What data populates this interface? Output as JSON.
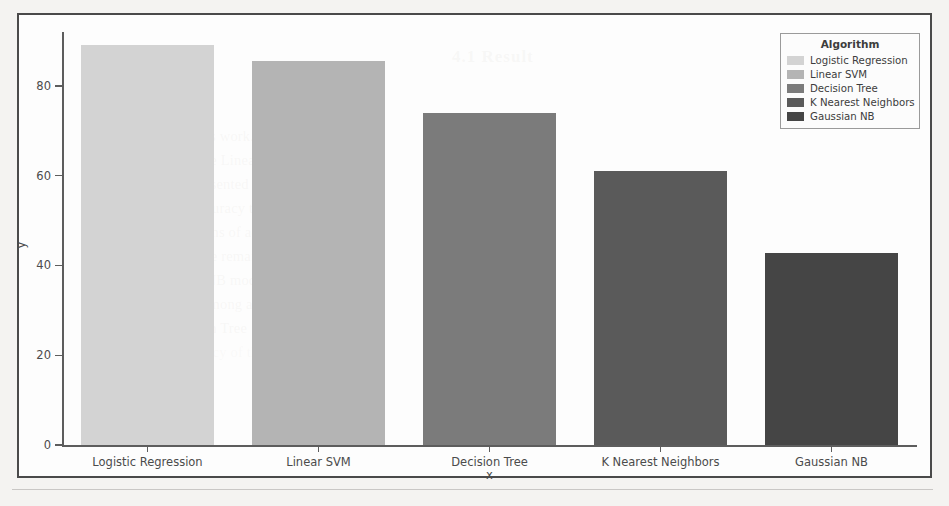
{
  "document": {
    "bleed_heading": "4.1  Result",
    "bleed_lines": [
      "considered in this work. The",
      "classification in the Linear SVM model",
      "features are presented in table-1. This",
      "that has better accuracy than other",
      "classifiers in terms of accuracy of 89%",
      "compared with the remaining model",
      "The Gaussian NB model gives the",
      "lowest accuracy among all the models",
      "and the Decision Tree",
      "and the accuracy of the"
    ]
  },
  "figure": {
    "legend": {
      "title": "Algorithm",
      "entries": [
        {
          "label": "Logistic Regression",
          "color": "#d3d3d3"
        },
        {
          "label": "Linear SVM",
          "color": "#b4b4b4"
        },
        {
          "label": "Decision Tree",
          "color": "#7b7b7b"
        },
        {
          "label": "K Nearest Neighbors",
          "color": "#5a5a5a"
        },
        {
          "label": "Gaussian NB",
          "color": "#454545"
        }
      ]
    },
    "axis": {
      "xlabel": "x",
      "ylabel": "y",
      "yticks": [
        "0",
        "20",
        "40",
        "60",
        "80"
      ],
      "ytick_values": [
        0,
        20,
        40,
        60,
        80
      ]
    }
  },
  "chart_data": {
    "type": "bar",
    "title": "",
    "xlabel": "x",
    "ylabel": "y",
    "categories": [
      "Logistic Regression",
      "Linear SVM",
      "Decision Tree",
      "K Nearest Neighbors",
      "Gaussian NB"
    ],
    "values": [
      89,
      85.6,
      73.9,
      61.1,
      42.8
    ],
    "colors": [
      "#d3d3d3",
      "#b4b4b4",
      "#7b7b7b",
      "#5a5a5a",
      "#454545"
    ],
    "series": [
      {
        "name": "Algorithm",
        "values": [
          89,
          85.6,
          73.9,
          61.1,
          42.8
        ]
      }
    ],
    "ylim": [
      0,
      92
    ],
    "xlim": [
      -0.5,
      4.5
    ],
    "grid": false,
    "legend_position": "upper right",
    "legend_title": "Algorithm",
    "bar_width_ratio": 0.78
  }
}
